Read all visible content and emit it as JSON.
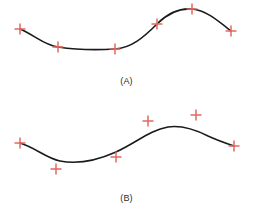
{
  "figure": {
    "background_color": "#ffffff",
    "width": 253,
    "height": 211
  },
  "style": {
    "curve_color": "#1a1a1a",
    "curve_width": 1.6,
    "marker_color": "#e2695f",
    "marker_stroke_width": 1.5,
    "marker_size": 11,
    "caption_color": "#2b2b2b"
  },
  "panels": [
    {
      "id": "A",
      "caption": "(A)",
      "caption_x": 124,
      "caption_y": 83,
      "marker_name": "data-point-marker",
      "curve_name": "fitted-curve-a",
      "curve_path": "M 20,29 C 36,36 44,45 58,47 C 78,50 98,50 115,49 C 131,48 143,38 157,24 C 168,13 180,8 192,9 C 205,10 216,19 231,31",
      "points": [
        {
          "x": 20,
          "y": 29,
          "label": "p1"
        },
        {
          "x": 58,
          "y": 47,
          "label": "p2"
        },
        {
          "x": 115,
          "y": 49,
          "label": "p3"
        },
        {
          "x": 157,
          "y": 24,
          "label": "p4"
        },
        {
          "x": 192,
          "y": 9,
          "label": "p5"
        },
        {
          "x": 231,
          "y": 31,
          "label": "p6"
        }
      ]
    },
    {
      "id": "B",
      "caption": "(B)",
      "caption_x": 124,
      "caption_y": 200,
      "marker_name": "data-point-marker",
      "curve_name": "fitted-curve-b",
      "curve_path": "M 20,143 C 36,148 46,158 60,161 C 80,165 98,160 116,152 C 136,143 150,130 168,127 C 182,125 196,130 208,136 C 219,141 228,144 234,146",
      "points": [
        {
          "x": 20,
          "y": 143,
          "label": "p1"
        },
        {
          "x": 56,
          "y": 169,
          "label": "p2"
        },
        {
          "x": 116,
          "y": 157,
          "label": "p3"
        },
        {
          "x": 148,
          "y": 121,
          "label": "p4"
        },
        {
          "x": 196,
          "y": 115,
          "label": "p5"
        },
        {
          "x": 234,
          "y": 146,
          "label": "p6"
        }
      ]
    }
  ]
}
